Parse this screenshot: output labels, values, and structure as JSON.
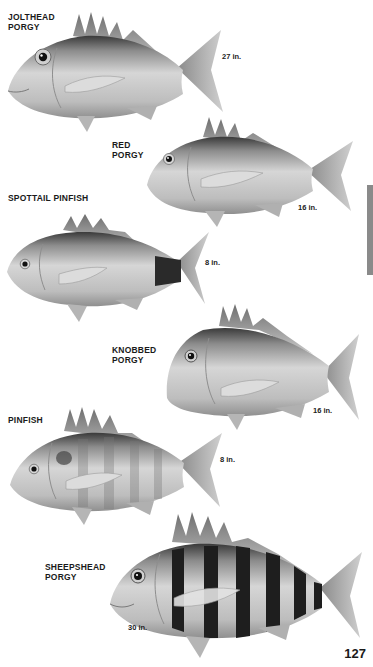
{
  "page": {
    "number": "127",
    "side_tab_color": "#8a8a8a",
    "background": "#ffffff"
  },
  "fish": [
    {
      "id": "jolthead-porgy",
      "name": "JOLTHEAD\nPORGY",
      "size": "27 in.",
      "stripes": false,
      "spot_tail": false,
      "body_tone": "#b9b9b9"
    },
    {
      "id": "red-porgy",
      "name": "RED\nPORGY",
      "size": "16 in.",
      "stripes": false,
      "spot_tail": false,
      "body_tone": "#c2c2c2"
    },
    {
      "id": "spottail-pinfish",
      "name": "SPOTTAIL PINFISH",
      "size": "8 in.",
      "stripes": false,
      "spot_tail": true,
      "body_tone": "#bdbdbd"
    },
    {
      "id": "knobbed-porgy",
      "name": "KNOBBED\nPORGY",
      "size": "16 in.",
      "stripes": false,
      "spot_tail": false,
      "body_tone": "#bcbcbc"
    },
    {
      "id": "pinfish",
      "name": "PINFISH",
      "size": "8 in.",
      "stripes": "faint",
      "spot_tail": false,
      "body_tone": "#bababa"
    },
    {
      "id": "sheepshead-porgy",
      "name": "SHEEPSHEAD\nPORGY",
      "size": "30 in.",
      "stripes": "bold",
      "spot_tail": false,
      "body_tone": "#cfcfcf"
    }
  ]
}
